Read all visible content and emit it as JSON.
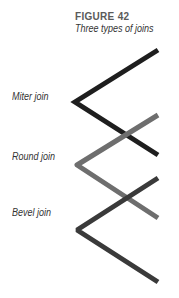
{
  "figure": {
    "title": "FIGURE 42",
    "subtitle": "Three types of joins"
  },
  "joins": [
    {
      "label": "Miter join",
      "linejoin": "miter",
      "color": "#1e1e1e",
      "label_top": 91,
      "points": "158,50 75,102 158,155"
    },
    {
      "label": "Round join",
      "linejoin": "round",
      "color": "#6e6e6e",
      "label_top": 151,
      "points": "158,115 77,165 158,218"
    },
    {
      "label": "Bevel join",
      "linejoin": "bevel",
      "color": "#3a3a3a",
      "label_top": 207,
      "points": "158,178 77,230 158,282"
    }
  ]
}
